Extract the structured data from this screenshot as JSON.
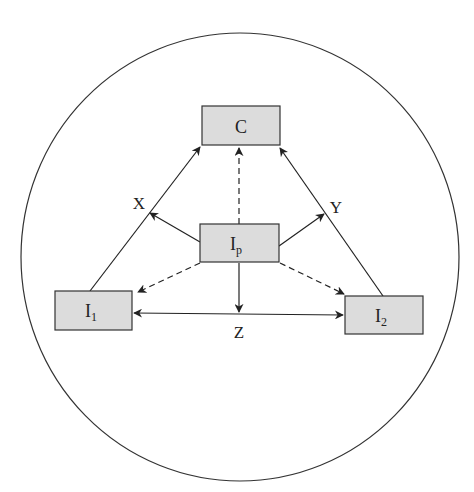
{
  "diagram": {
    "nodes": {
      "C": {
        "label": "C",
        "sub": ""
      },
      "Ip": {
        "label": "I",
        "sub": "p"
      },
      "I1": {
        "label": "I",
        "sub": "1"
      },
      "I2": {
        "label": "I",
        "sub": "2"
      }
    },
    "edge_labels": {
      "X": "X",
      "Y": "Y",
      "Z": "Z"
    },
    "colors": {
      "box_fill": "#dcdcdc",
      "stroke": "#2a2a2a",
      "background": "#ffffff"
    }
  }
}
